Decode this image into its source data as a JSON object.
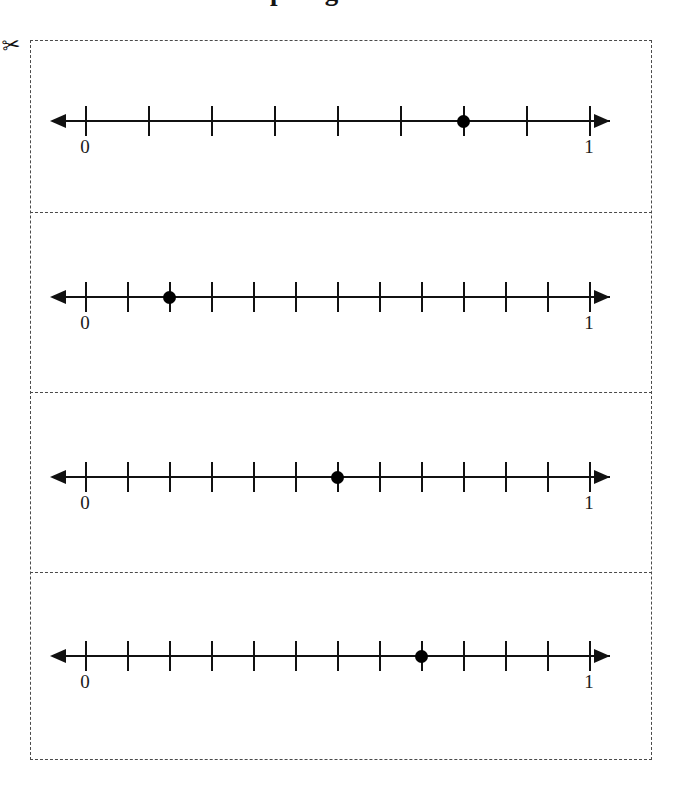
{
  "page": {
    "clipped_title": "Graphing Fractions",
    "cut_marker_icon": "scissors-icon",
    "frame_style": "dashed-cut-border"
  },
  "chart_data": {
    "type": "line",
    "xlabel": "",
    "ylabel": "",
    "grid": false,
    "legend": null,
    "axis_start_label": "0",
    "axis_end_label": "1",
    "xlim": [
      0,
      1
    ],
    "problems": [
      {
        "index": 1,
        "divisions": 8,
        "tick_fractions": [
          "0",
          "1/8",
          "2/8",
          "3/8",
          "4/8",
          "5/8",
          "6/8",
          "7/8",
          "1"
        ],
        "point_tick_index": 6,
        "point_value": 0.75,
        "point_fraction": "6/8",
        "start_label": "0",
        "end_label": "1"
      },
      {
        "index": 2,
        "divisions": 12,
        "tick_fractions": [
          "0",
          "1/12",
          "2/12",
          "3/12",
          "4/12",
          "5/12",
          "6/12",
          "7/12",
          "8/12",
          "9/12",
          "10/12",
          "11/12",
          "1"
        ],
        "point_tick_index": 2,
        "point_value": 0.1667,
        "point_fraction": "2/12",
        "start_label": "0",
        "end_label": "1"
      },
      {
        "index": 3,
        "divisions": 12,
        "tick_fractions": [
          "0",
          "1/12",
          "2/12",
          "3/12",
          "4/12",
          "5/12",
          "6/12",
          "7/12",
          "8/12",
          "9/12",
          "10/12",
          "11/12",
          "1"
        ],
        "point_tick_index": 6,
        "point_value": 0.5,
        "point_fraction": "6/12",
        "start_label": "0",
        "end_label": "1"
      },
      {
        "index": 4,
        "divisions": 12,
        "tick_fractions": [
          "0",
          "1/12",
          "2/12",
          "3/12",
          "4/12",
          "5/12",
          "6/12",
          "7/12",
          "8/12",
          "9/12",
          "10/12",
          "11/12",
          "1"
        ],
        "point_tick_index": 8,
        "point_value": 0.6667,
        "point_fraction": "8/12",
        "start_label": "0",
        "end_label": "1"
      }
    ]
  },
  "layout": {
    "axis_left_px": 85,
    "axis_right_px": 589,
    "row_axis_y": [
      121,
      297,
      477,
      656
    ],
    "divider_y": [
      212,
      392,
      572
    ]
  },
  "colors": {
    "ink": "#111111",
    "cut_line": "#4a4a4a",
    "paper": "#ffffff"
  }
}
